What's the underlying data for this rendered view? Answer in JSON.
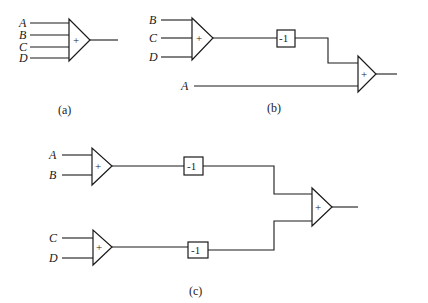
{
  "diagram": {
    "colors": {
      "ink": "#1a1a1a",
      "background": "#ffffff"
    },
    "adder_symbol": "+",
    "gain_label": "-1",
    "panel_a": {
      "caption": "(a)",
      "inputs": [
        "A",
        "B",
        "C",
        "D"
      ]
    },
    "panel_b": {
      "caption": "(b)",
      "first_adder_inputs": [
        "B",
        "C",
        "D"
      ],
      "direct_input": "A"
    },
    "panel_c": {
      "caption": "(c)",
      "top_adder_inputs": [
        "A",
        "B"
      ],
      "bottom_adder_inputs": [
        "C",
        "D"
      ]
    }
  }
}
